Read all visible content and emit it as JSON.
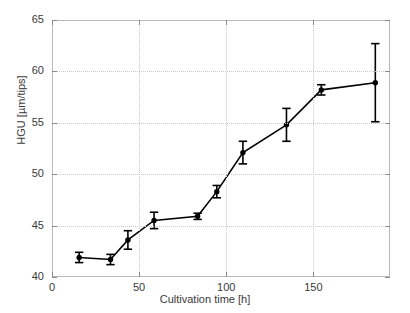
{
  "chart_data": {
    "type": "line",
    "title": "",
    "xlabel": "Cultivation time [h]",
    "ylabel": "HGU [µm/tips]",
    "xlim": [
      0,
      194
    ],
    "ylim": [
      40,
      65
    ],
    "xticks": [
      0,
      50,
      100,
      150
    ],
    "yticks": [
      40,
      45,
      50,
      55,
      60,
      65
    ],
    "xticklabels": [
      "0",
      "50",
      "100",
      "150"
    ],
    "yticklabels": [
      "40",
      "45",
      "50",
      "55",
      "60",
      "65"
    ],
    "grid": true,
    "legend": null,
    "marker": "circle",
    "line_color": "#000000",
    "marker_color": "#000000",
    "errorbar_color": "#000000",
    "x": [
      15,
      33,
      43,
      58,
      83,
      94,
      109,
      134,
      154,
      185
    ],
    "y": [
      42.0,
      41.8,
      43.7,
      45.6,
      46.0,
      48.4,
      52.2,
      54.9,
      58.3,
      59.0
    ],
    "yerr": [
      0.5,
      0.5,
      0.9,
      0.8,
      0.3,
      0.6,
      1.1,
      1.6,
      0.5,
      3.8
    ],
    "series": [
      {
        "name": "HGU",
        "x": [
          15,
          33,
          43,
          58,
          83,
          94,
          109,
          134,
          154,
          185
        ],
        "values": [
          42.0,
          41.8,
          43.7,
          45.6,
          46.0,
          48.4,
          52.2,
          54.9,
          58.3,
          59.0
        ],
        "yerr": [
          0.5,
          0.5,
          0.9,
          0.8,
          0.3,
          0.6,
          1.1,
          1.6,
          0.5,
          3.8
        ]
      }
    ]
  }
}
